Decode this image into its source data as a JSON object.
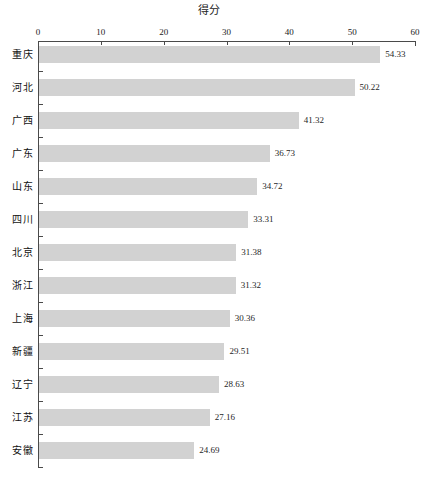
{
  "chart_data": {
    "type": "bar",
    "orientation": "horizontal",
    "title": "得分",
    "xlabel": "",
    "ylabel": "",
    "xlim": [
      0,
      60
    ],
    "xticks": [
      0,
      10,
      20,
      30,
      40,
      50,
      60
    ],
    "xtick_labels": [
      "0",
      "10",
      "20",
      "30",
      "40",
      "50",
      "60"
    ],
    "grid": false,
    "legend": null,
    "bar_color": "#d2d2d2",
    "axis_color": "#4a4a4a",
    "categories": [
      "重庆",
      "河北",
      "广西",
      "广东",
      "山东",
      "四川",
      "北京",
      "浙江",
      "上海",
      "新疆",
      "辽宁",
      "江苏",
      "安徽"
    ],
    "values": [
      54.33,
      50.22,
      41.32,
      36.73,
      34.72,
      33.31,
      31.38,
      31.32,
      30.36,
      29.51,
      28.63,
      27.16,
      24.69
    ],
    "value_labels": [
      "54.33",
      "50.22",
      "41.32",
      "36.73",
      "34.72",
      "33.31",
      "31.38",
      "31.32",
      "30.36",
      "29.51",
      "28.63",
      "27.16",
      "24.69"
    ]
  }
}
